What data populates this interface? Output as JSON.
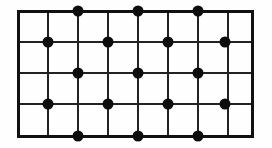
{
  "figure": {
    "type": "geometric-diagram",
    "background_color": "#fefefe",
    "canvas": {
      "width": 272,
      "height": 148
    }
  },
  "grid": {
    "columns": 7,
    "rows": 4,
    "vertical_line_count": 8,
    "horizontal_line_count": 5,
    "vertical_line_x": [
      18,
      48,
      78,
      108,
      138,
      168,
      198,
      228,
      252
    ],
    "horizontal_line_y": [
      11,
      42,
      73,
      104,
      136
    ],
    "outer_border": {
      "color": "#111111",
      "width": 3,
      "left": 18,
      "top": 11,
      "right": 252,
      "bottom": 136
    },
    "inner_line": {
      "color": "#222222",
      "width": 2
    }
  },
  "dots": {
    "color": "#0d0d0d",
    "radius": 5.5,
    "count": 18,
    "pattern_note": "Alternating offset rows; odd rows mark even columns, even rows mark odd columns",
    "points": [
      {
        "x": 78,
        "y": 11,
        "row": 1,
        "col": 2
      },
      {
        "x": 138,
        "y": 11,
        "row": 1,
        "col": 4
      },
      {
        "x": 198,
        "y": 11,
        "row": 1,
        "col": 6
      },
      {
        "x": 48,
        "y": 42,
        "row": 2,
        "col": 1
      },
      {
        "x": 108,
        "y": 42,
        "row": 2,
        "col": 3
      },
      {
        "x": 168,
        "y": 42,
        "row": 2,
        "col": 5
      },
      {
        "x": 225,
        "y": 42,
        "row": 2,
        "col": 7
      },
      {
        "x": 78,
        "y": 73,
        "row": 3,
        "col": 2
      },
      {
        "x": 138,
        "y": 73,
        "row": 3,
        "col": 4
      },
      {
        "x": 198,
        "y": 73,
        "row": 3,
        "col": 6
      },
      {
        "x": 48,
        "y": 104,
        "row": 4,
        "col": 1
      },
      {
        "x": 108,
        "y": 104,
        "row": 4,
        "col": 3
      },
      {
        "x": 168,
        "y": 104,
        "row": 4,
        "col": 5
      },
      {
        "x": 225,
        "y": 104,
        "row": 4,
        "col": 7
      },
      {
        "x": 78,
        "y": 136,
        "row": 5,
        "col": 2
      },
      {
        "x": 138,
        "y": 136,
        "row": 5,
        "col": 4
      },
      {
        "x": 198,
        "y": 136,
        "row": 5,
        "col": 6
      }
    ]
  }
}
